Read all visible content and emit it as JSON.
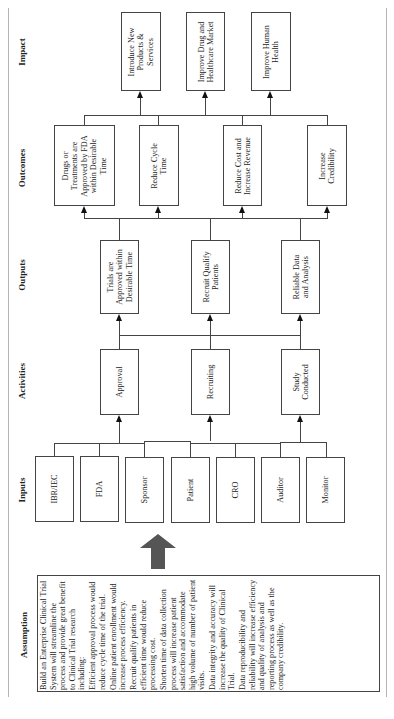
{
  "stage_labels": {
    "impact": "Impact",
    "outcomes": "Outcomes",
    "outputs": "Outputs",
    "activities": "Activities",
    "inputs": "Inputs",
    "assumption": "Assumption"
  },
  "impact": [
    {
      "line1": "Introduce New",
      "line2": "Products &",
      "line3": "Services"
    },
    {
      "line1": "Improve Drug and",
      "line2": "Healthcare Market"
    },
    {
      "line1": "Improve Human",
      "line2": "Health"
    }
  ],
  "outcomes": [
    {
      "line1": "Drugs or",
      "line2": "Treatments are",
      "line3": "Approved by FDA",
      "line4": "within Desirable",
      "line5": "Time"
    },
    {
      "line1": "Reduce Cycle",
      "line2": "Time"
    },
    {
      "line1": "Reduce Cost and",
      "line2": "Increase Revenue"
    },
    {
      "line1": "Increase",
      "line2": "Credibility"
    }
  ],
  "outputs": [
    {
      "line1": "Trials are",
      "line2": "Approved within",
      "line3": "Desirable  Time"
    },
    {
      "line1": "Recruit Qualify",
      "line2": "Patients"
    },
    {
      "line1": "Reliable Data",
      "line2": "and Analysis"
    }
  ],
  "activities": [
    {
      "line1": "Approval"
    },
    {
      "line1": "Recruiting"
    },
    {
      "line1": "Study",
      "line2": "Conducted"
    }
  ],
  "inputs": [
    "IBR/IEC",
    "FDA",
    "Sponsor",
    "Patient",
    "CRO",
    "Auditor",
    "Monitor"
  ],
  "assumption": {
    "paragraphs": [
      "Build an Enterprise Clinical Trial System will streamline the process and provide great benefit to Clinical Trial research including:",
      "Efficient approval process would reduce cycle time of the trial.",
      "Online patient enrollment would increase process efficiency.",
      "Recruit qualify patients in efficient time would reduce processing cost.",
      "Shorten time of data collection process will increase patient satisfaction and accommodate high volume of number of patient visits.",
      "Data integrity and accuracy will increase the quality of Clinical Trial.",
      "Data reproducibility and reliability will increase efficiency and quality of analysis and reporting process as well as the company credibility."
    ]
  },
  "colors": {
    "box_border": "#444444",
    "frame": "#b5b5b5",
    "big_arrow": "#555555"
  }
}
